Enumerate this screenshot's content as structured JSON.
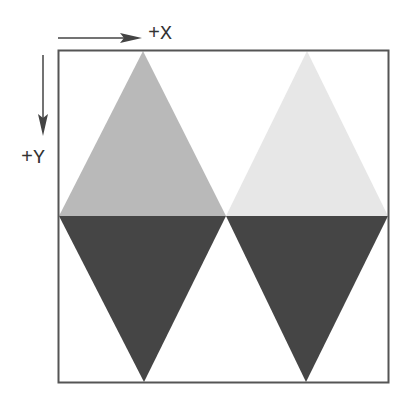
{
  "diagram": {
    "axes": {
      "x_label": "+X",
      "y_label": "+Y"
    },
    "frame": {
      "x": 58,
      "y": 50,
      "width": 331,
      "height": 333
    },
    "colors": {
      "upper_left": "#b9b9b9",
      "upper_right": "#e7e7e7",
      "lower_left": "#454545",
      "lower_right": "#454545",
      "frame": "#555555",
      "arrow": "#444444"
    },
    "shapes": [
      {
        "name": "upper-left-triangle",
        "points": "143,51 59,216 226,216"
      },
      {
        "name": "upper-right-triangle",
        "points": "307,51 226,216 388,216"
      },
      {
        "name": "lower-left-triangle",
        "points": "59,216 226,216 144,382"
      },
      {
        "name": "lower-right-triangle",
        "points": "226,216 388,216 306,382"
      }
    ]
  }
}
